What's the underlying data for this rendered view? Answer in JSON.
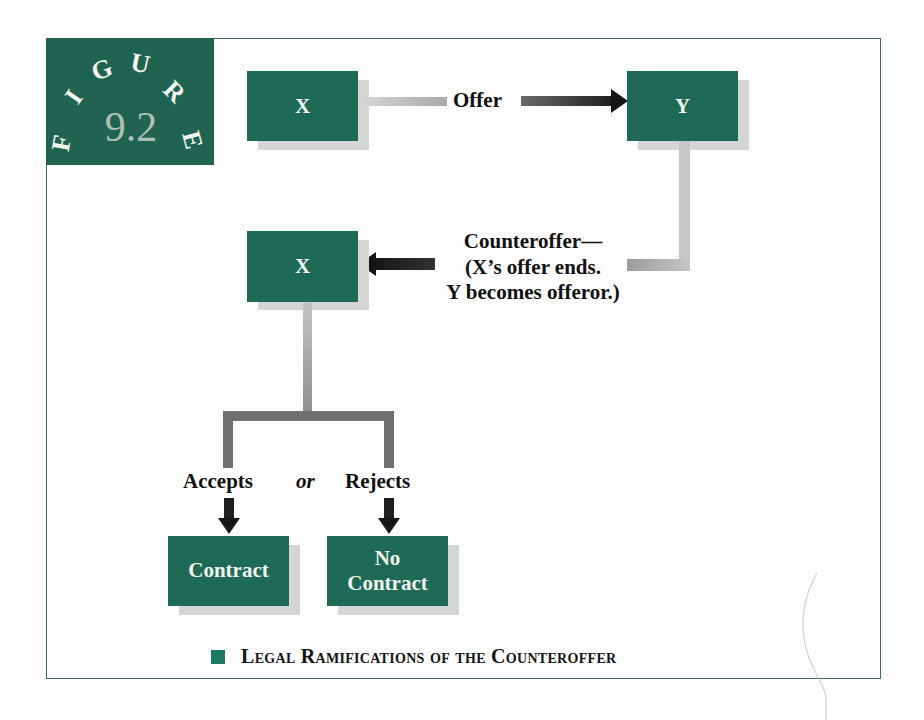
{
  "figure": {
    "badge_letters": [
      "F",
      "I",
      "G",
      "U",
      "R",
      "E"
    ],
    "number": "9.2",
    "caption": "Legal Ramifications of the Counteroffer"
  },
  "colors": {
    "box_fill": "#1f6a56",
    "badge_fill": "#1f6350",
    "frame_border": "#3d6e60",
    "connector_light": "#c4c4c4",
    "connector_dark": "#2a2a2a",
    "shadow": "#d4d6d4",
    "caption_square": "#1f7a62"
  },
  "nodes": {
    "offeror_x": "X",
    "offeree_y": "Y",
    "counter_x": "X",
    "contract": "Contract",
    "no_contract_line1": "No",
    "no_contract_line2": "Contract"
  },
  "edges": {
    "offer": "Offer",
    "counteroffer_line1": "Counteroffer—",
    "counteroffer_line2": "(X’s offer ends.",
    "counteroffer_line3": "Y becomes offeror.)",
    "accepts": "Accepts",
    "or": "or",
    "rejects": "Rejects"
  }
}
